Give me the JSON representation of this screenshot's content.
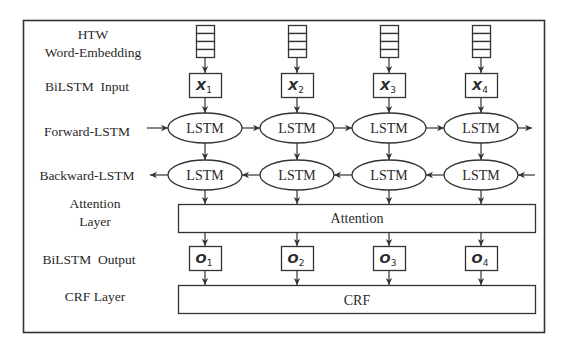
{
  "diagram": {
    "row_labels": {
      "embedding_line1": "HTW",
      "embedding_line2": "Word-Embedding",
      "input": "BiLSTM  Input",
      "forward": "Forward-LSTM",
      "backward": "Backward-LSTM",
      "attention_line1": "Attention",
      "attention_line2": "Layer",
      "output": "BiLSTM  Output",
      "crf": "CRF Layer"
    },
    "columns": [
      {
        "input_var": "X",
        "input_sub": "1",
        "forward": "LSTM",
        "backward": "LSTM",
        "output_var": "O",
        "output_sub": "1"
      },
      {
        "input_var": "X",
        "input_sub": "2",
        "forward": "LSTM",
        "backward": "LSTM",
        "output_var": "O",
        "output_sub": "2"
      },
      {
        "input_var": "X",
        "input_sub": "3",
        "forward": "LSTM",
        "backward": "LSTM",
        "output_var": "O",
        "output_sub": "3"
      },
      {
        "input_var": "X",
        "input_sub": "4",
        "forward": "LSTM",
        "backward": "LSTM",
        "output_var": "O",
        "output_sub": "4"
      }
    ],
    "attention_label": "Attention",
    "crf_label": "CRF",
    "embedding_cells": 4,
    "colors": {
      "stroke": "#333333",
      "text": "#2a2a2a",
      "background": "#ffffff"
    }
  }
}
